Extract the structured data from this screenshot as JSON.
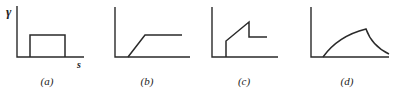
{
  "figure": {
    "y_axis_label": "γ",
    "x_axis_label": "s",
    "panels": [
      {
        "id": "a",
        "caption": "(a)",
        "shape": "rectangular pulse"
      },
      {
        "id": "b",
        "caption": "(b)",
        "shape": "linear ramp then constant"
      },
      {
        "id": "c",
        "caption": "(c)",
        "shape": "step up, linear ramp, step down, constant"
      },
      {
        "id": "d",
        "caption": "(d)",
        "shape": "concave rise to peak then decay"
      }
    ]
  },
  "colors": {
    "line": "#2a2a2a",
    "background": "#ffffff"
  }
}
